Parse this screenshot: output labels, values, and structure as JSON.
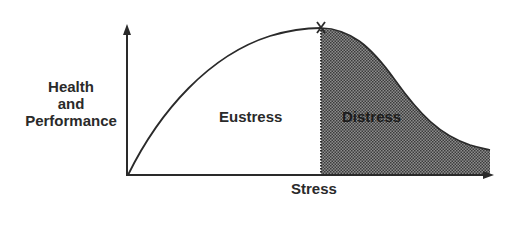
{
  "diagram": {
    "type": "stress-performance-curve",
    "y_axis": {
      "label_lines": [
        "Health",
        "and",
        "Performance"
      ]
    },
    "x_axis": {
      "label": "Stress"
    },
    "regions": [
      {
        "name": "eustress",
        "label": "Eustress",
        "fill": "#ffffff"
      },
      {
        "name": "distress",
        "label": "Distress",
        "fill": "#6e6e6e",
        "pattern": "dotted-halftone"
      }
    ],
    "peak_marker": {
      "glyph": "X"
    },
    "colors": {
      "line": "#2a2a2a",
      "shade_dark": "#4a4a4a",
      "shade_light": "#9a9a9a",
      "background": "#ffffff"
    }
  }
}
